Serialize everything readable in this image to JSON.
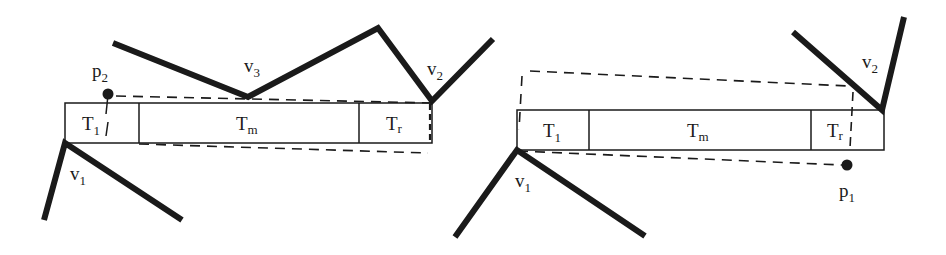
{
  "figure": {
    "left_panel": {
      "cells": [
        {
          "main": "T",
          "sub": "1"
        },
        {
          "main": "T",
          "sub": "m"
        },
        {
          "main": "T",
          "sub": "r"
        }
      ],
      "vertices": [
        {
          "main": "v",
          "sub": "1"
        },
        {
          "main": "v",
          "sub": "2"
        },
        {
          "main": "v",
          "sub": "3"
        }
      ],
      "point": {
        "main": "p",
        "sub": "2"
      }
    },
    "right_panel": {
      "cells": [
        {
          "main": "T",
          "sub": "1"
        },
        {
          "main": "T",
          "sub": "m"
        },
        {
          "main": "T",
          "sub": "r"
        }
      ],
      "vertices": [
        {
          "main": "v",
          "sub": "1"
        },
        {
          "main": "v",
          "sub": "2"
        }
      ],
      "point": {
        "main": "p",
        "sub": "1"
      }
    },
    "colors": {
      "ink": "#1a1a1a",
      "background": "#ffffff"
    }
  }
}
